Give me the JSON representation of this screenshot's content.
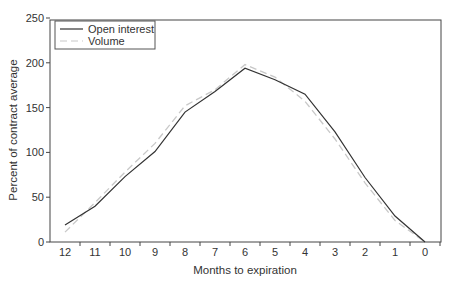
{
  "chart_data": {
    "type": "line",
    "title": "",
    "xlabel": "Months to expiration",
    "ylabel": "Percent of contract average",
    "x": [
      12,
      11,
      10,
      9,
      8,
      7,
      6,
      5,
      4,
      3,
      2,
      1,
      0
    ],
    "x_tick_labels": [
      "12",
      "11",
      "10",
      "9",
      "8",
      "7",
      "6",
      "5",
      "4",
      "3",
      "2",
      "1",
      "0"
    ],
    "y_ticks": [
      0,
      50,
      100,
      150,
      200,
      250
    ],
    "y_tick_labels": [
      "0",
      "50",
      "100",
      "150",
      "200",
      "250"
    ],
    "ylim": [
      0,
      250
    ],
    "grid": false,
    "legend_position": "upper left",
    "series": [
      {
        "name": "Open interest",
        "style": "solid",
        "color": "#333333",
        "values": [
          19,
          40,
          73,
          101,
          145,
          168,
          194,
          181,
          165,
          123,
          72,
          29,
          0
        ]
      },
      {
        "name": "Volume",
        "style": "dashed",
        "color": "#c8c8c8",
        "values": [
          11,
          44,
          78,
          110,
          152,
          170,
          198,
          184,
          157,
          115,
          66,
          24,
          0
        ]
      }
    ]
  },
  "legend": {
    "items": [
      {
        "label": "Open interest"
      },
      {
        "label": "Volume"
      }
    ]
  },
  "axes": {
    "x_title": "Months to expiration",
    "y_title": "Percent of contract average"
  }
}
